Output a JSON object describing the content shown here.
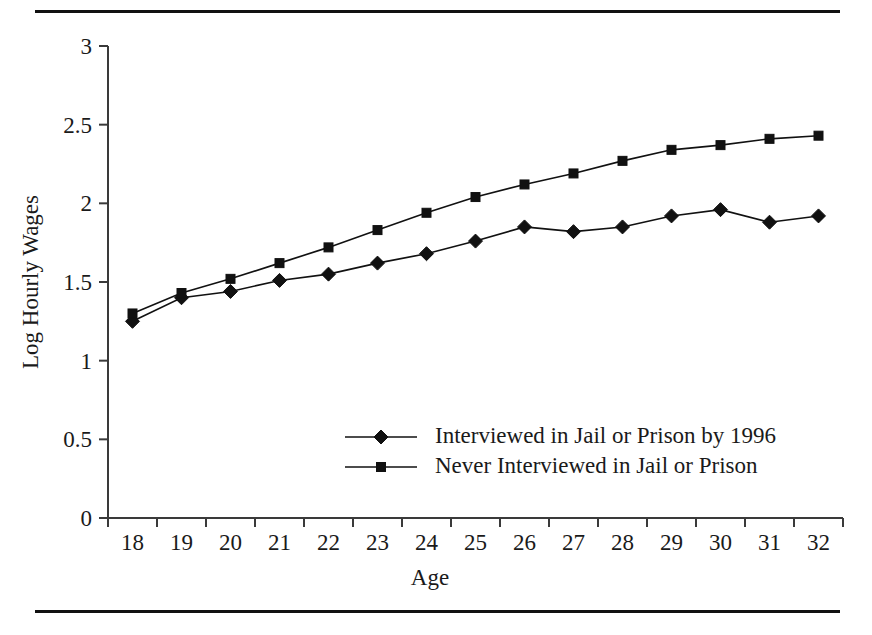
{
  "figure": {
    "rules": [
      "top-rule",
      "bottom-rule"
    ]
  },
  "chart_data": {
    "type": "line",
    "title": "",
    "xlabel": "Age",
    "ylabel": "Log Hourly Wages",
    "categories": [
      18,
      19,
      20,
      21,
      22,
      23,
      24,
      25,
      26,
      27,
      28,
      29,
      30,
      31,
      32
    ],
    "x_tick_labels": [
      "18",
      "19",
      "20",
      "21",
      "22",
      "23",
      "24",
      "25",
      "26",
      "27",
      "28",
      "29",
      "30",
      "31",
      "32"
    ],
    "y_tick_labels": [
      "0",
      "0.5",
      "1",
      "1.5",
      "2",
      "2.5",
      "3"
    ],
    "y_ticks": [
      0,
      0.5,
      1,
      1.5,
      2,
      2.5,
      3
    ],
    "ylim": [
      0,
      3
    ],
    "xlim": [
      18,
      32
    ],
    "grid": false,
    "legend_position": "inside-lower-center",
    "series": [
      {
        "name": "Interviewed in Jail or Prison by 1996",
        "marker": "diamond",
        "color": "#111111",
        "values": [
          1.25,
          1.4,
          1.44,
          1.51,
          1.55,
          1.62,
          1.68,
          1.76,
          1.85,
          1.82,
          1.85,
          1.92,
          1.96,
          1.88,
          1.92
        ]
      },
      {
        "name": "Never Interviewed in Jail or Prison",
        "marker": "square",
        "color": "#111111",
        "values": [
          1.3,
          1.43,
          1.52,
          1.62,
          1.72,
          1.83,
          1.94,
          2.04,
          2.12,
          2.19,
          2.27,
          2.34,
          2.37,
          2.41,
          2.43
        ]
      }
    ]
  }
}
